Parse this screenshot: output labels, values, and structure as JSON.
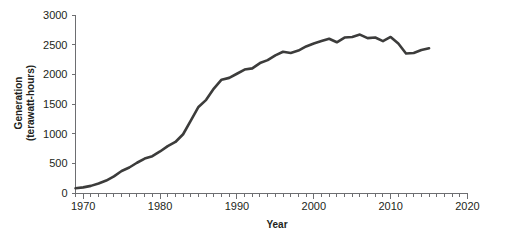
{
  "chart_data": {
    "type": "line",
    "title": "",
    "xlabel": "Year",
    "ylabel": "Generation (terawatt-hours)",
    "ylabel_line1": "Generation",
    "ylabel_line2": "(terawatt-hours)",
    "xlim": [
      1969,
      2020
    ],
    "ylim": [
      0,
      3000
    ],
    "x_ticks_major": [
      1970,
      1980,
      1990,
      2000,
      2010,
      2020
    ],
    "x_tick_labels": [
      "1970",
      "1980",
      "1990",
      "2000",
      "2010",
      "2020"
    ],
    "x_tick_minor_step": 1,
    "y_ticks": [
      0,
      500,
      1000,
      1500,
      2000,
      2500,
      3000
    ],
    "y_tick_labels": [
      "0",
      "500",
      "1000",
      "1500",
      "2000",
      "2500",
      "3000"
    ],
    "grid": false,
    "legend": false,
    "series": [
      {
        "name": "Nuclear electricity generation",
        "color": "#3c3c3b",
        "x": [
          1969,
          1970,
          1971,
          1972,
          1973,
          1974,
          1975,
          1976,
          1977,
          1978,
          1979,
          1980,
          1981,
          1982,
          1983,
          1984,
          1985,
          1986,
          1987,
          1988,
          1989,
          1990,
          1991,
          1992,
          1993,
          1994,
          1995,
          1996,
          1997,
          1998,
          1999,
          2000,
          2001,
          2002,
          2003,
          2004,
          2005,
          2006,
          2007,
          2008,
          2009,
          2010,
          2011,
          2012,
          2013,
          2014,
          2015
        ],
        "values": [
          80,
          95,
          120,
          160,
          210,
          280,
          370,
          430,
          510,
          580,
          620,
          700,
          790,
          860,
          990,
          1220,
          1450,
          1570,
          1760,
          1910,
          1940,
          2010,
          2080,
          2100,
          2190,
          2240,
          2320,
          2380,
          2360,
          2400,
          2470,
          2520,
          2560,
          2600,
          2540,
          2620,
          2630,
          2670,
          2610,
          2620,
          2560,
          2630,
          2520,
          2350,
          2360,
          2410,
          2440
        ]
      }
    ]
  },
  "axis_colors": {
    "line": "#6d6e71",
    "text": "#231f20",
    "series": "#3c3c3b"
  }
}
